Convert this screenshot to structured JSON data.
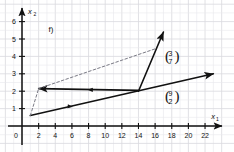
{
  "chart_data": {
    "type": "line",
    "title": "",
    "subtitle": "",
    "problem_label": "f)",
    "xlabel": "x",
    "xlabel_sub": "1",
    "ylabel": "x",
    "ylabel_sub": "2",
    "xlim": [
      0,
      23.5
    ],
    "ylim": [
      0,
      6.6
    ],
    "grid": true,
    "grid_step_x": 1,
    "grid_step_y": 0.5,
    "legend_position": "none",
    "x_ticks": [
      0,
      2,
      4,
      6,
      8,
      10,
      12,
      14,
      16,
      18,
      20,
      22
    ],
    "x_tick_labels": [
      "0",
      "2",
      "4",
      "6",
      "8",
      "10",
      "12",
      "14",
      "16",
      "18",
      "20",
      "22"
    ],
    "y_ticks": [
      0,
      1,
      2,
      3,
      4,
      5,
      6
    ],
    "y_tick_labels": [
      "0",
      "1",
      "2",
      "3",
      "4",
      "5",
      "6"
    ],
    "origin_label": "0",
    "series": [
      {
        "name": "vector-9-2",
        "style": "solid",
        "arrow": true,
        "points": [
          [
            1,
            0.6
          ],
          [
            23,
            3.0
          ]
        ],
        "label": "(9/2)",
        "label_top": "9",
        "label_bottom": "2"
      },
      {
        "name": "vector-3-7",
        "style": "solid",
        "arrow": true,
        "points": [
          [
            14,
            2.0
          ],
          [
            17,
            5.4
          ]
        ],
        "label": "(3/7)",
        "label_top": "3",
        "label_bottom": "7"
      },
      {
        "name": "horizontal-vector",
        "style": "solid",
        "arrow": true,
        "points": [
          [
            14,
            2.05
          ],
          [
            2,
            2.15
          ]
        ]
      },
      {
        "name": "dashed-construction-lower",
        "style": "dashed",
        "arrow": false,
        "points": [
          [
            1,
            0.6
          ],
          [
            2,
            2.15
          ]
        ]
      },
      {
        "name": "dashed-construction-upper",
        "style": "dashed",
        "arrow": false,
        "points": [
          [
            2,
            2.15
          ],
          [
            16.1,
            4.45
          ]
        ]
      }
    ],
    "annotations": [
      {
        "name": "vector-label-3-7",
        "text_top": "3",
        "text_bottom": "7",
        "x": 17.3,
        "y": 4.0
      },
      {
        "name": "vector-label-9-2",
        "text_top": "9",
        "text_bottom": "2",
        "x": 17.3,
        "y": 1.7
      },
      {
        "name": "problem-label",
        "text": "f)",
        "x": 3.2,
        "y": 5.4
      }
    ],
    "colors": {
      "grid": "#d9d9de",
      "grid_minor": "#e8e8ec",
      "axis": "#111111",
      "line": "#111111",
      "dashed": "#7a7a85",
      "background": "#ffffff"
    }
  }
}
